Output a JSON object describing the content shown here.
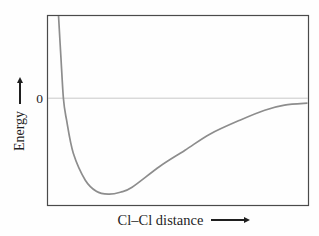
{
  "figure": {
    "y_axis": {
      "label": "Energy",
      "zero_label": "0"
    },
    "x_axis": {
      "label": "Cl–Cl distance"
    }
  },
  "colors": {
    "curve": "#8d8d8d",
    "frame": "#4a4a4a",
    "zero_line": "#c9c9c9",
    "text": "#1f1f1f",
    "background": "#fefefe"
  },
  "chart_data": {
    "type": "line",
    "title": "",
    "xlabel": "Cl–Cl distance",
    "ylabel": "Energy",
    "x_tick_labels": [],
    "y_tick_labels": [
      "0"
    ],
    "grid": false,
    "legend": false,
    "axes_note": "Both axes are unlabeled arbitrary units; only the zero-energy reference line is marked. Distance normalized 0-1 across plot width; energy normalized so curve minimum (bond energy) = -1 and the zero line = 0.",
    "curve_description": "Potential energy of two chlorine atoms vs internuclear distance: steep repulsive rise at short distance, zero crossing, minimum at equilibrium bond length, asymptotic approach to zero at large separation.",
    "zero_crossing_x": 0.061,
    "minimum": {
      "x": 0.233,
      "energy": -1.0
    },
    "series": [
      {
        "name": "Cl–Cl potential energy curve",
        "points_normalized": [
          [
            0.042,
            0.865
          ],
          [
            0.05,
            0.5
          ],
          [
            0.061,
            0.0
          ],
          [
            0.073,
            -0.229
          ],
          [
            0.099,
            -0.573
          ],
          [
            0.145,
            -0.854
          ],
          [
            0.187,
            -0.969
          ],
          [
            0.233,
            -1.0
          ],
          [
            0.279,
            -0.979
          ],
          [
            0.324,
            -0.927
          ],
          [
            0.431,
            -0.708
          ],
          [
            0.527,
            -0.542
          ],
          [
            0.622,
            -0.375
          ],
          [
            0.737,
            -0.229
          ],
          [
            0.832,
            -0.125
          ],
          [
            0.908,
            -0.073
          ],
          [
            0.996,
            -0.052
          ]
        ]
      }
    ]
  }
}
